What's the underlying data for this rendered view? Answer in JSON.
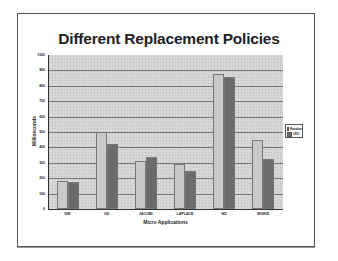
{
  "chart_data": {
    "type": "bar",
    "title": "Different Replacement Policies",
    "xlabel": "Micro Applications",
    "ylabel": "Milliseconds",
    "categories": [
      "DW",
      "GD",
      "JACOBI",
      "LAPLACE",
      "ND",
      "MGRID"
    ],
    "series": [
      {
        "name": "Random",
        "color": "#c9c9c9",
        "values": [
          180,
          500,
          310,
          290,
          875,
          450
        ]
      },
      {
        "name": "LRU",
        "color": "#6b6b6b",
        "values": [
          178,
          425,
          340,
          250,
          860,
          325
        ]
      }
    ],
    "ylim": [
      0,
      1000
    ],
    "yticks": [
      "0",
      "100",
      "200",
      "300",
      "400",
      "500",
      "600",
      "700",
      "800",
      "900",
      "1000"
    ],
    "grid": true,
    "legend_position": "right"
  }
}
